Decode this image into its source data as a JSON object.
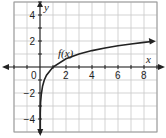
{
  "chart_data": {
    "type": "line",
    "title": "",
    "function_label": "f(x)",
    "xlabel": "x",
    "ylabel": "y",
    "xlim": [
      -2,
      9
    ],
    "ylim": [
      -5,
      5
    ],
    "grid": true,
    "x_ticks": [
      0,
      2,
      4,
      6,
      8
    ],
    "y_ticks": [
      4,
      2,
      -2,
      -4
    ],
    "x_tick_labels": [
      "0",
      "2",
      "4",
      "6",
      "8"
    ],
    "y_tick_labels": [
      "4",
      "2",
      "−2",
      "−4"
    ],
    "series": [
      {
        "name": "f(x)",
        "x": [
          0.02,
          0.05,
          0.1,
          0.2,
          0.33,
          0.5,
          1,
          2,
          3,
          4,
          5,
          6,
          7,
          8,
          8.6
        ],
        "y": [
          -3.56,
          -2.73,
          -2.1,
          -1.46,
          -1.0,
          -0.63,
          0,
          0.63,
          1,
          1.26,
          1.46,
          1.63,
          1.77,
          1.89,
          1.96
        ]
      }
    ],
    "legend": "none",
    "colors": {
      "grid": "#c8c8c8",
      "axis": "#222222",
      "curve": "#222222",
      "frame": "#9a9a9a"
    }
  }
}
